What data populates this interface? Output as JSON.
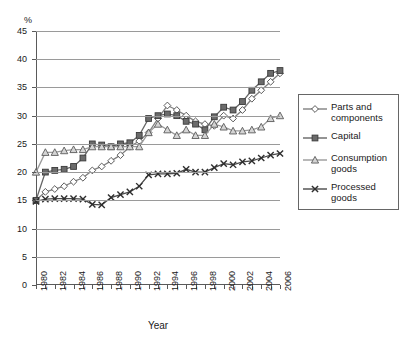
{
  "axis": {
    "y_unit_label": "%",
    "x_title": "Year",
    "y_ticks": [
      0,
      5,
      10,
      15,
      20,
      25,
      30,
      35,
      40,
      45
    ],
    "x_ticks_labeled": [
      1980,
      1982,
      1984,
      1986,
      1988,
      1990,
      1992,
      1994,
      1996,
      1998,
      2000,
      2002,
      2004,
      2006
    ]
  },
  "legend": {
    "items": [
      {
        "label": "Parts and components",
        "marker": "diamond-open",
        "color": "#808080"
      },
      {
        "label": "Capital",
        "marker": "square-filled",
        "color": "#666666"
      },
      {
        "label": "Consumption goods",
        "marker": "triangle-open",
        "color": "#9a9a9a"
      },
      {
        "label": "Processed goods",
        "marker": "cross-x",
        "color": "#4a4a4a"
      }
    ]
  },
  "chart_data": {
    "type": "line",
    "title": "",
    "xlabel": "Year",
    "ylabel": "%",
    "ylim": [
      0,
      45
    ],
    "xlim": [
      1980,
      2006
    ],
    "grid": true,
    "legend_position": "right",
    "x": [
      1980,
      1981,
      1982,
      1983,
      1984,
      1985,
      1986,
      1987,
      1988,
      1989,
      1990,
      1991,
      1992,
      1993,
      1994,
      1995,
      1996,
      1997,
      1998,
      1999,
      2000,
      2001,
      2002,
      2003,
      2004,
      2005,
      2006
    ],
    "series": [
      {
        "name": "Parts and components",
        "marker": "diamond-open",
        "color": "#808080",
        "values": [
          15.0,
          16.5,
          17.0,
          17.5,
          18.3,
          19.0,
          20.3,
          21.0,
          22.0,
          23.0,
          24.5,
          25.5,
          27.0,
          29.5,
          31.8,
          31.0,
          30.0,
          29.0,
          28.5,
          28.2,
          30.0,
          29.5,
          31.0,
          33.0,
          34.5,
          36.0,
          37.5
        ]
      },
      {
        "name": "Capital",
        "marker": "square-filled",
        "color": "#666666",
        "values": [
          15.0,
          20.0,
          20.3,
          20.5,
          21.0,
          22.5,
          25.0,
          24.8,
          24.5,
          25.0,
          25.2,
          26.5,
          29.5,
          30.0,
          30.3,
          30.0,
          29.0,
          28.5,
          27.5,
          29.8,
          31.5,
          31.0,
          32.5,
          34.5,
          36.0,
          37.5,
          38.0
        ]
      },
      {
        "name": "Consumption goods",
        "marker": "triangle-open",
        "color": "#9a9a9a",
        "values": [
          20.0,
          23.5,
          23.5,
          23.8,
          24.0,
          24.0,
          24.5,
          24.5,
          24.5,
          24.5,
          24.5,
          24.5,
          27.0,
          28.5,
          27.5,
          26.5,
          27.5,
          26.5,
          26.5,
          28.5,
          28.0,
          27.3,
          27.3,
          27.5,
          28.0,
          29.5,
          30.0
        ]
      },
      {
        "name": "Processed goods",
        "marker": "cross-x",
        "color": "#4a4a4a",
        "values": [
          14.8,
          15.2,
          15.3,
          15.3,
          15.3,
          15.2,
          14.3,
          14.2,
          15.5,
          16.0,
          16.5,
          17.5,
          19.5,
          19.7,
          19.7,
          19.8,
          20.5,
          20.0,
          20.0,
          20.8,
          21.5,
          21.3,
          21.8,
          22.0,
          22.5,
          23.0,
          23.3
        ]
      }
    ]
  }
}
